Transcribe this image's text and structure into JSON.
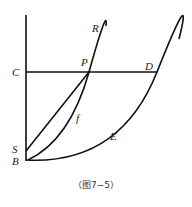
{
  "figure": {
    "caption": "（图7−5）",
    "labels": {
      "C": "C",
      "P": "P",
      "D": "D",
      "R": "R",
      "S": "S",
      "B": "B",
      "f": "f",
      "E": "E"
    },
    "points": {
      "C": [
        26,
        72
      ],
      "P": [
        89,
        72
      ],
      "D": [
        157,
        72
      ],
      "S": [
        26,
        151
      ],
      "B": [
        26,
        160
      ],
      "R_end": [
        106,
        26
      ],
      "E_end": [
        179,
        39
      ],
      "axis_top": [
        26,
        15
      ]
    },
    "elements": [
      "vertical axis from top to B",
      "horizontal line C–P–D",
      "straight line S–P",
      "curve f from B through P to R",
      "curve E from B through D"
    ],
    "line_color": "#111111"
  }
}
